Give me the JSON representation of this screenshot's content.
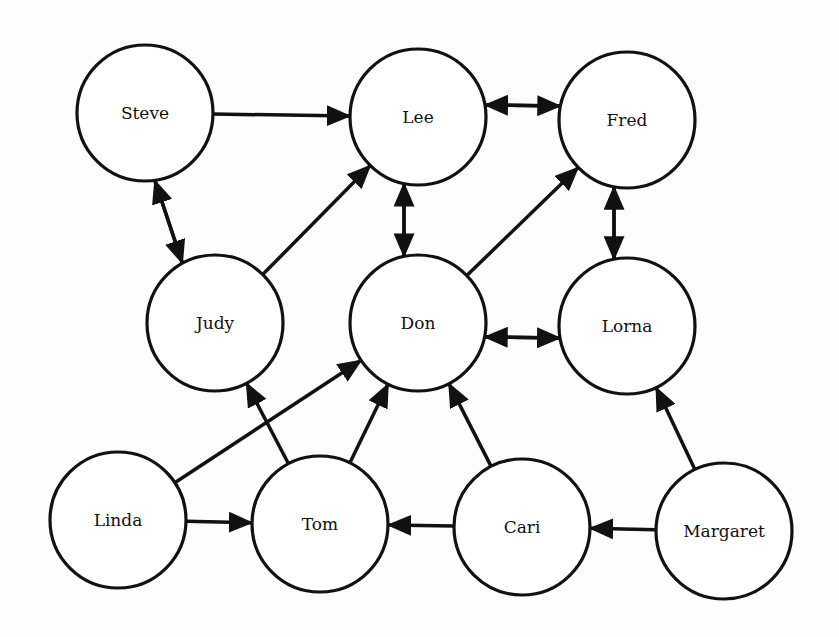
{
  "diagram": {
    "type": "directed-graph",
    "node_radius": 68,
    "colors": {
      "stroke": "#111111",
      "fill": "#ffffff",
      "background": "#fdfdfd"
    },
    "nodes": [
      {
        "id": "steve",
        "label": "Steve",
        "x": 145,
        "y": 113
      },
      {
        "id": "lee",
        "label": "Lee",
        "x": 418,
        "y": 117
      },
      {
        "id": "fred",
        "label": "Fred",
        "x": 627,
        "y": 120
      },
      {
        "id": "judy",
        "label": "Judy",
        "x": 215,
        "y": 323
      },
      {
        "id": "don",
        "label": "Don",
        "x": 418,
        "y": 323
      },
      {
        "id": "lorna",
        "label": "Lorna",
        "x": 627,
        "y": 326
      },
      {
        "id": "linda",
        "label": "Linda",
        "x": 118,
        "y": 520
      },
      {
        "id": "tom",
        "label": "Tom",
        "x": 320,
        "y": 524
      },
      {
        "id": "cari",
        "label": "Cari",
        "x": 522,
        "y": 527
      },
      {
        "id": "margaret",
        "label": "Margaret",
        "x": 724,
        "y": 531
      }
    ],
    "edges": [
      {
        "from": "steve",
        "to": "lee",
        "offset": 0
      },
      {
        "from": "lee",
        "to": "fred",
        "offset": -13
      },
      {
        "from": "fred",
        "to": "lee",
        "offset": -13
      },
      {
        "from": "steve",
        "to": "judy",
        "offset": 12
      },
      {
        "from": "judy",
        "to": "steve",
        "offset": 12
      },
      {
        "from": "judy",
        "to": "lee",
        "offset": 0
      },
      {
        "from": "lee",
        "to": "don",
        "offset": 14
      },
      {
        "from": "don",
        "to": "lee",
        "offset": 14
      },
      {
        "from": "don",
        "to": "fred",
        "offset": 0
      },
      {
        "from": "fred",
        "to": "lorna",
        "offset": 13
      },
      {
        "from": "lorna",
        "to": "fred",
        "offset": 13
      },
      {
        "from": "lorna",
        "to": "don",
        "offset": 13
      },
      {
        "from": "don",
        "to": "lorna",
        "offset": 13
      },
      {
        "from": "linda",
        "to": "don",
        "offset": 0
      },
      {
        "from": "linda",
        "to": "tom",
        "offset": 0
      },
      {
        "from": "tom",
        "to": "judy",
        "offset": 0
      },
      {
        "from": "tom",
        "to": "don",
        "offset": 0
      },
      {
        "from": "cari",
        "to": "don",
        "offset": 0
      },
      {
        "from": "cari",
        "to": "tom",
        "offset": 0
      },
      {
        "from": "margaret",
        "to": "lorna",
        "offset": 0
      },
      {
        "from": "margaret",
        "to": "cari",
        "offset": 0
      }
    ]
  }
}
